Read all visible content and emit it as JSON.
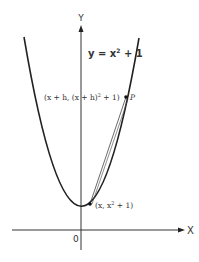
{
  "diagram": {
    "equation": {
      "prefix": "y = x",
      "exp": "2",
      "suffix": " + 1"
    },
    "axes": {
      "y_label": "Y",
      "x_label": "X",
      "origin_label": "0"
    },
    "point_P": {
      "label": "P",
      "coord_text": "(x + h, (x + h)",
      "coord_exp": "2",
      "coord_tail": " + 1)"
    },
    "point_Q": {
      "coord_text": "(x, x",
      "coord_exp": "2",
      "coord_tail": " + 1)"
    },
    "colors": {
      "curve": "#222222",
      "axis": "#333333",
      "text": "#333333"
    }
  }
}
